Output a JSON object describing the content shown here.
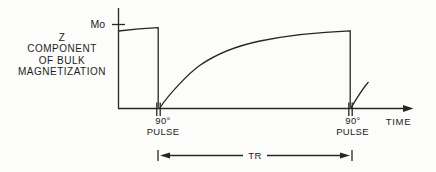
{
  "figure": {
    "title_meaning": "Z component of bulk magnetization vs time",
    "colors": {
      "ink": "#262626",
      "background": "#fcfcfa"
    },
    "y_axis": {
      "label_lines": [
        "Z",
        "COMPONENT",
        "OF BULK",
        "MAGNETIZATION"
      ],
      "max_tick_label": "Mo"
    },
    "x_axis": {
      "label": "TIME"
    },
    "pulses": [
      {
        "line1": "90°",
        "line2": "PULSE"
      },
      {
        "line1": "90°",
        "line2": "PULSE"
      }
    ],
    "interval": {
      "label": "TR"
    }
  }
}
